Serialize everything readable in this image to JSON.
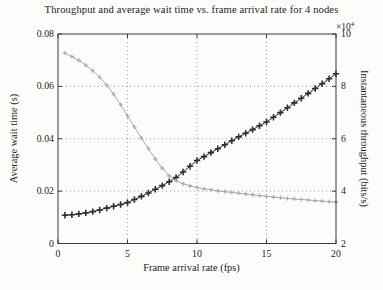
{
  "figure": {
    "background": "#fcfcfa",
    "axis_color": "#3a3a3a",
    "grid_color": "#9a9a9a"
  },
  "chart_data": {
    "type": "line",
    "title": "Throughput and average wait time vs. frame arrival rate for 4 nodes",
    "xlabel": "Frame arrival rate (fps)",
    "ylabel_left": "Average wait time (s)",
    "ylabel_right": "Instantaneous throughput (bits/s)",
    "right_axis_multiplier": "×10",
    "right_axis_exponent": "4",
    "xlim": [
      0,
      20
    ],
    "x_ticks": [
      0,
      5,
      10,
      15,
      20
    ],
    "x_tick_labels": [
      "0",
      "5",
      "10",
      "15",
      "20"
    ],
    "ylim_left": [
      0,
      0.08
    ],
    "y_ticks_left": [
      0,
      0.02,
      0.04,
      0.06,
      0.08
    ],
    "y_tick_labels_left": [
      "0",
      "0.02",
      "0.04",
      "0.06",
      "0.08"
    ],
    "ylim_right": [
      2,
      10
    ],
    "y_ticks_right": [
      2,
      4,
      6,
      8,
      10
    ],
    "y_tick_labels_right": [
      "2",
      "4",
      "6",
      "8",
      "10"
    ],
    "grid": "dotted",
    "legend": "none",
    "series": [
      {
        "name": "Average wait time",
        "axis": "left",
        "units": "s",
        "color": "#2e2e2e",
        "marker": "plus",
        "marker_size": 6.4,
        "marker_stroke": 1.6,
        "line_width": 1.0,
        "x": [
          0.5,
          1,
          1.5,
          2,
          2.5,
          3,
          3.5,
          4,
          4.5,
          5,
          5.5,
          6,
          6.5,
          7,
          7.5,
          8,
          8.5,
          9,
          9.5,
          10,
          10.5,
          11,
          11.5,
          12,
          12.5,
          13,
          13.5,
          14,
          14.5,
          15,
          15.5,
          16,
          16.5,
          17,
          17.5,
          18,
          18.5,
          19,
          19.5,
          20
        ],
        "y": [
          0.0108,
          0.011,
          0.0113,
          0.0117,
          0.0122,
          0.0128,
          0.0135,
          0.0142,
          0.0149,
          0.0156,
          0.0168,
          0.018,
          0.0193,
          0.0207,
          0.0221,
          0.0236,
          0.0252,
          0.0273,
          0.0295,
          0.0317,
          0.0332,
          0.0347,
          0.0362,
          0.0377,
          0.0392,
          0.0407,
          0.0421,
          0.0435,
          0.045,
          0.0464,
          0.0482,
          0.05,
          0.0518,
          0.0537,
          0.0555,
          0.0573,
          0.0592,
          0.061,
          0.0629,
          0.0648
        ]
      },
      {
        "name": "Instantaneous throughput",
        "axis": "right",
        "units": "1e4 bits/s",
        "color": "#a8a8a8",
        "marker": "plus",
        "marker_size": 4.2,
        "marker_stroke": 1.1,
        "line_width": 1.0,
        "x": [
          0.5,
          1,
          1.5,
          2,
          2.5,
          3,
          3.5,
          4,
          4.5,
          5,
          5.5,
          6,
          6.5,
          7,
          7.5,
          8,
          8.5,
          9,
          9.5,
          10,
          10.5,
          11,
          11.5,
          12,
          12.5,
          13,
          13.5,
          14,
          14.5,
          15,
          15.5,
          16,
          16.5,
          17,
          17.5,
          18,
          18.5,
          19,
          19.5,
          20
        ],
        "y": [
          9.27,
          9.14,
          8.99,
          8.81,
          8.6,
          8.35,
          8.05,
          7.7,
          7.3,
          6.88,
          6.45,
          6.03,
          5.62,
          5.23,
          4.88,
          4.58,
          4.4,
          4.28,
          4.2,
          4.14,
          4.09,
          4.05,
          4.01,
          3.98,
          3.95,
          3.92,
          3.89,
          3.86,
          3.83,
          3.8,
          3.77,
          3.75,
          3.72,
          3.7,
          3.68,
          3.66,
          3.64,
          3.62,
          3.6,
          3.58
        ]
      }
    ],
    "plot_box_px": {
      "left": 58,
      "top": 34,
      "right": 336,
      "bottom": 243.5
    }
  }
}
